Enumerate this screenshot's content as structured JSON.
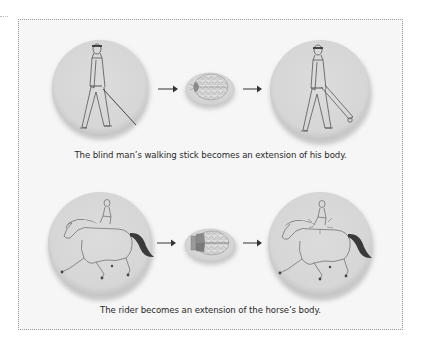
{
  "figure": {
    "rows": [
      {
        "id": "blind-man",
        "caption": "The blind man’s walking stick becomes an extension of his body.",
        "before_image": "blind-man-with-cane",
        "brain_image": "brain-with-small-cane-region",
        "after_image": "blind-man-cane-integrated-into-body"
      },
      {
        "id": "rider",
        "caption": "The rider becomes an extension of the horse’s body.",
        "before_image": "rider-on-horse",
        "brain_image": "brain-with-enlarged-horse-region",
        "after_image": "rider-merged-with-horse"
      }
    ],
    "colors": {
      "circle_fill": "#d9d9d9",
      "circle_shadow": "#b5b5b5",
      "line_art": "#555555",
      "horse_mane": "#3a3a3a",
      "brain_region_top": "#8a8a8a",
      "brain_region_bottom": "#7a7a7a",
      "arrow": "#333333",
      "frame_border": "#9a9a9a",
      "frame_fill": "#f6f6f6"
    }
  }
}
